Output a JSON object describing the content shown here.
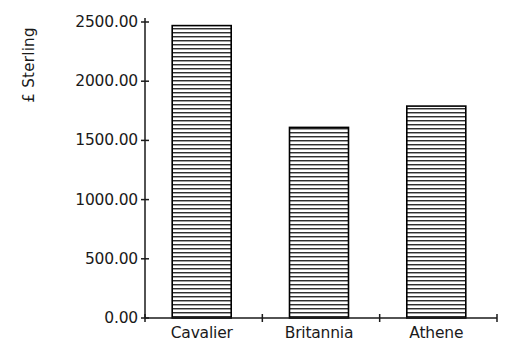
{
  "chart_data": {
    "type": "bar",
    "title": "",
    "subtitle": "",
    "xlabel": "",
    "ylabel": "£ Sterling",
    "categories": [
      "Cavalier",
      "Britannia",
      "Athene"
    ],
    "values": [
      2470.0,
      1610.0,
      1790.0
    ],
    "series": [
      {
        "name": "£ Sterling",
        "values": [
          2470.0,
          1610.0,
          1790.0
        ]
      }
    ],
    "ylim": [
      0,
      2500
    ],
    "yticks": [
      0,
      500,
      1000,
      1500,
      2000,
      2500
    ],
    "ytick_labels": [
      "0.00",
      "500.00",
      "1000.00",
      "1500.00",
      "2000.00",
      "2500.00"
    ],
    "grid": false,
    "legend": false,
    "legend_position": "none",
    "bar_fill": "horizontal-line-hatch",
    "bar_edge_color": "#000000",
    "bar_fill_color": "#ffffff",
    "hatch_color": "#2b2b2b",
    "axis_color": "#000000",
    "background_color": "#ffffff"
  },
  "axes": {
    "y_title": "£ Sterling",
    "y_tick_labels": [
      "2500.00",
      "2000.00",
      "1500.00",
      "1000.00",
      "500.00",
      "0.00"
    ],
    "x_tick_labels": [
      "Cavalier",
      "Britannia",
      "Athene"
    ]
  },
  "icons": {
    "y_axis_line": "vertical-axis-line",
    "x_axis_line": "horizontal-axis-line"
  }
}
